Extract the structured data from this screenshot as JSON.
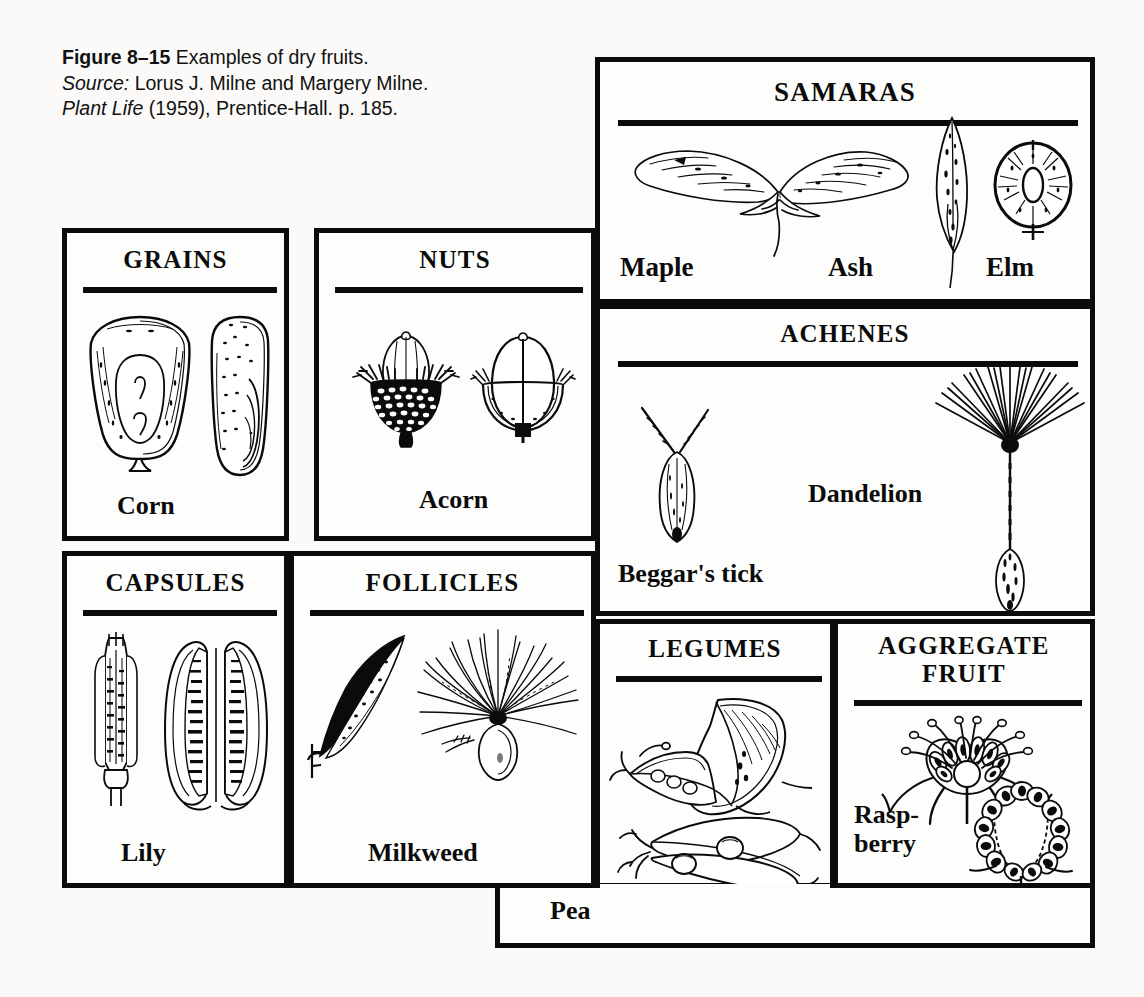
{
  "figure": {
    "number_label": "Figure 8–15",
    "caption_text": "Examples of dry fruits.",
    "source_prefix": "Source:",
    "source_authors": "Lorus J. Milne and Margery Milne.",
    "source_title": "Plant Life",
    "source_rest": "(1959), Prentice-Hall. p. 185."
  },
  "colors": {
    "ink": "#0b0b0b",
    "paper": "#fdfdfb",
    "page_background": "#fbfaf8"
  },
  "panels": [
    {
      "id": "grains",
      "title": "GRAINS",
      "specimens": [
        {
          "name": "Corn",
          "label": "Corn",
          "views": [
            "face view of kernel",
            "side view of kernel"
          ]
        }
      ]
    },
    {
      "id": "nuts",
      "title": "NUTS",
      "specimens": [
        {
          "name": "Acorn",
          "label": "Acorn",
          "views": [
            "whole acorn in scaly cup",
            "longitudinal section"
          ]
        }
      ]
    },
    {
      "id": "samaras",
      "title": "SAMARAS",
      "specimens": [
        {
          "name": "Maple",
          "label": "Maple",
          "views": [
            "double winged samara"
          ]
        },
        {
          "name": "Ash",
          "label": "Ash",
          "views": [
            "single elongate winged samara"
          ]
        },
        {
          "name": "Elm",
          "label": "Elm",
          "views": [
            "round winged samara"
          ]
        }
      ]
    },
    {
      "id": "achenes",
      "title": "ACHENES",
      "specimens": [
        {
          "name": "Beggar's tick",
          "label": "Beggar's tick",
          "views": [
            "achene with two barbed awns"
          ]
        },
        {
          "name": "Dandelion",
          "label": "Dandelion",
          "views": [
            "achene with pappus parachute"
          ]
        }
      ]
    },
    {
      "id": "capsules",
      "title": "CAPSULES",
      "specimens": [
        {
          "name": "Lily",
          "label": "Lily",
          "views": [
            "closed capsule",
            "split capsule showing seeds"
          ]
        }
      ]
    },
    {
      "id": "follicles",
      "title": "FOLLICLES",
      "specimens": [
        {
          "name": "Milkweed",
          "label": "Milkweed",
          "views": [
            "follicle pod",
            "seed with silky coma"
          ]
        }
      ]
    },
    {
      "id": "legumes",
      "title": "LEGUMES",
      "specimens": [
        {
          "name": "Pea",
          "label": "Pea",
          "views": [
            "opened curved pod",
            "split pod with peas"
          ]
        }
      ]
    },
    {
      "id": "aggregate_fruit",
      "title": "AGGREGATE\nFRUIT",
      "specimens": [
        {
          "name": "Raspberry",
          "label": "Rasp-\nberry",
          "views": [
            "flower longitudinal section",
            "fruit longitudinal section"
          ]
        }
      ]
    }
  ]
}
